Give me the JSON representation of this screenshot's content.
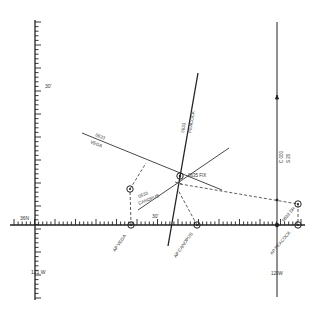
{
  "diagram": {
    "colors": {
      "background": "#ffffff",
      "ink": "#222222",
      "label": "#333333"
    },
    "axes": {
      "vertical_left": {
        "x": 35,
        "y_top": 20,
        "y_bottom": 300,
        "labels": {
          "lat_30": "30'",
          "lon_121": "121 W"
        }
      },
      "horizontal": {
        "y": 225,
        "x_left": 10,
        "x_right": 305,
        "labels": {
          "lat_36N": "36N",
          "lon_30": "30'"
        }
      },
      "vertical_right": {
        "x": 277,
        "y_top": 22,
        "y_bottom": 297,
        "labels": {
          "course": "C 000",
          "speed": "S 20",
          "lon_120": "120W"
        }
      }
    },
    "lines_of_position": [
      {
        "id": "vega",
        "time": "0633",
        "star": "VEGA",
        "x1": 82,
        "y1": 133,
        "x2": 222,
        "y2": 190
      },
      {
        "id": "peacock",
        "time": "0633",
        "star": "PEACOCK",
        "x1": 198,
        "y1": 73,
        "x2": 168,
        "y2": 246
      },
      {
        "id": "canopus",
        "time": "0633",
        "star": "CANOPUS",
        "x1": 138,
        "y1": 210,
        "x2": 229,
        "y2": 148
      }
    ],
    "fix": {
      "label": "0635 FIX",
      "x": 180,
      "y": 176
    },
    "dr_position": {
      "label": "0633 DR",
      "x": 298,
      "y": 204
    },
    "assumed_positions": [
      {
        "id": "ap-vega",
        "label": "AP VEGA",
        "x": 131,
        "y": 225
      },
      {
        "id": "ap-canopus",
        "label": "AP CANOPUS",
        "x": 197,
        "y": 225
      },
      {
        "id": "ap-peacock",
        "label": "AP PEACOCK",
        "x": 298,
        "y": 225
      }
    ],
    "markers": {
      "vega_circle": {
        "x": 130,
        "y": 189
      },
      "course_arrow": {
        "x": 277,
        "y": 97
      }
    }
  }
}
